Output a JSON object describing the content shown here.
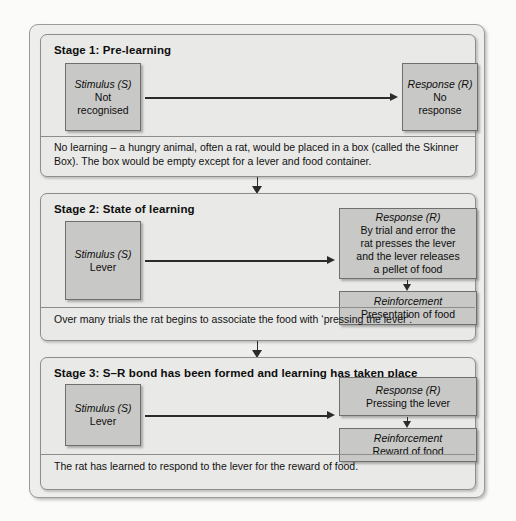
{
  "diagram": {
    "colors": {
      "panel_background": "#eeeeec",
      "stage_background": "#e9e9e7",
      "box_fill": "#c8c8c6",
      "box_border": "#6f6f6d",
      "arrow": "#2b2b2b",
      "text": "#111111"
    }
  },
  "stages": [
    {
      "title": "Stage 1: Pre-learning",
      "stimulus": {
        "header": "Stimulus (S)",
        "body_line_1": "Not",
        "body_line_2": "recognised"
      },
      "response": {
        "header": "Response (R)",
        "body_line_1": "No",
        "body_line_2": "response"
      },
      "caption": "No learning – a hungry animal, often a rat, would be placed in a box (called the Skinner Box). The box would be empty except for a lever and food container."
    },
    {
      "title": "Stage 2: State of learning",
      "stimulus": {
        "header": "Stimulus (S)",
        "body_line_1": "Lever"
      },
      "response": {
        "header": "Response (R)",
        "body_line_1": "By trial and error the",
        "body_line_2": "rat presses the lever",
        "body_line_3": "and the lever releases",
        "body_line_4": "a pellet of food"
      },
      "reinforcement": {
        "header": "Reinforcement",
        "body_line_1": "Presentation of food"
      },
      "caption": "Over many trials the rat begins to associate the food with ‘pressing the lever’."
    },
    {
      "title": "Stage 3: S–R bond has been formed and learning has taken place",
      "stimulus": {
        "header": "Stimulus (S)",
        "body_line_1": "Lever"
      },
      "response": {
        "header": "Response (R)",
        "body_line_1": "Pressing the lever"
      },
      "reinforcement": {
        "header": "Reinforcement",
        "body_line_1": "Reward of food"
      },
      "caption": "The rat has learned to respond to the lever for the reward of food."
    }
  ]
}
